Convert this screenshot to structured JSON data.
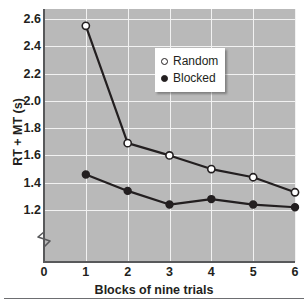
{
  "chart_data": {
    "type": "line",
    "title": "",
    "xlabel": "Blocks of nine trials",
    "ylabel": "RT + MT (s)",
    "x": [
      1,
      2,
      3,
      4,
      5,
      6
    ],
    "xticks": [
      "0",
      "1",
      "2",
      "3",
      "4",
      "5",
      "6"
    ],
    "xtick_values": [
      0,
      1,
      2,
      3,
      4,
      5,
      6
    ],
    "xlim": [
      0,
      6
    ],
    "yticks": [
      "1.2",
      "1.4",
      "1.6",
      "1.8",
      "2.0",
      "2.2",
      "2.4",
      "2.6"
    ],
    "ytick_values": [
      1.2,
      1.4,
      1.6,
      1.8,
      2.0,
      2.2,
      2.4,
      2.6
    ],
    "ylim": [
      1.2,
      2.6
    ],
    "y_axis_break": true,
    "grid": true,
    "grid_color": "#f2f2f2",
    "plot_background": "#b9b9b9",
    "legend_position": "upper right",
    "series": [
      {
        "name": "Random",
        "marker": "open-circle",
        "color": "#231f20",
        "values": [
          2.55,
          1.69,
          1.6,
          1.5,
          1.44,
          1.33
        ]
      },
      {
        "name": "Blocked",
        "marker": "filled-circle",
        "color": "#231f20",
        "values": [
          1.46,
          1.34,
          1.24,
          1.28,
          1.24,
          1.22
        ]
      }
    ]
  },
  "legend": {
    "entries": [
      {
        "label": "Random",
        "marker": "open-circle"
      },
      {
        "label": "Blocked",
        "marker": "filled-circle"
      }
    ]
  }
}
